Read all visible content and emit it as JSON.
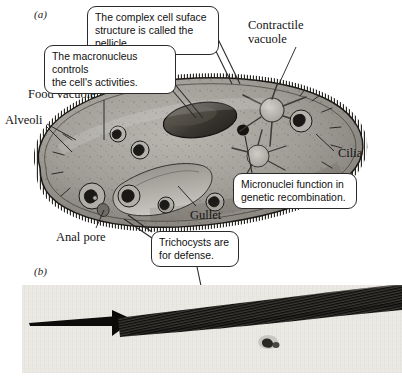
{
  "figure": {
    "panels": [
      {
        "letter": "(a)",
        "kind": "labeled-diagram",
        "subject": "Paramecium cell anatomy"
      },
      {
        "letter": "(b)",
        "kind": "micrograph",
        "subject": "discharged trichocyst"
      }
    ]
  },
  "callouts": [
    {
      "name": "pellicle",
      "line1": "The complex cell suface",
      "line2": "structure is called the pellicle."
    },
    {
      "name": "macronucleus",
      "line1": "The macronucleus controls",
      "line2": "the cell's activities."
    },
    {
      "name": "micronuclei",
      "line1": "Micronuclei function in",
      "line2": "genetic recombination."
    },
    {
      "name": "trichocysts",
      "line1": "Trichocysts are",
      "line2": "for defense."
    }
  ],
  "labels": [
    {
      "name": "contractile-vacuole",
      "line1": "Contractile",
      "line2": "vacuole"
    },
    {
      "name": "food-vacuole",
      "line1": "Food vacuole",
      "line2": ""
    },
    {
      "name": "alveoli",
      "line1": "Alveoli",
      "line2": ""
    },
    {
      "name": "cilia",
      "line1": "Cilia",
      "line2": ""
    },
    {
      "name": "gullet",
      "line1": "Gullet",
      "line2": ""
    },
    {
      "name": "anal-pore",
      "line1": "Anal pore",
      "line2": ""
    }
  ],
  "colors": {
    "background": "#ffffff",
    "ink": "#141414",
    "callout_border": "#2a2a2a",
    "cell_fill": "#9a9791",
    "cell_dark": "#4a4742",
    "micrograph_bg": "#eceae4",
    "micrograph_ink": "#141414"
  }
}
